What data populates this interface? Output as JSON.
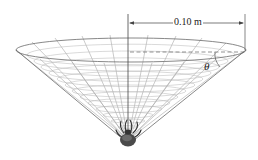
{
  "figure": {
    "dimension_label": "0.10 m",
    "angle_label": "θ",
    "colors": {
      "lines": "#555555",
      "web": "#9a9a9a",
      "spider": "#3a3a3a",
      "background": "#ffffff"
    }
  }
}
